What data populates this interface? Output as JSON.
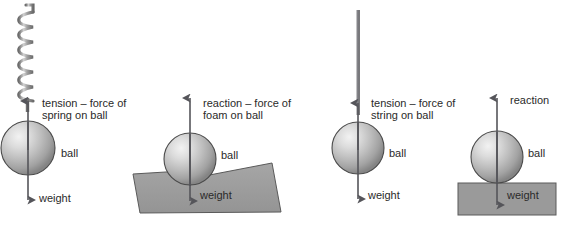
{
  "figure": {
    "background_color": "#ffffff",
    "ball_label": "ball",
    "weight_label": "weight",
    "colors": {
      "ball_fill_light": "#eeeeee",
      "ball_fill_mid": "#b9b9b9",
      "ball_fill_dark": "#8a8a8a",
      "ball_outline": "#4a4a4a",
      "support_fill": "#9a9a9a",
      "support_outline": "#5a5a5a",
      "arrow": "#55555a",
      "spring": "#7a7a7a",
      "string": "#5f5f63",
      "text": "#2a2a2a"
    }
  },
  "panels": [
    {
      "id": "spring-ball",
      "name": "ball-hanging-from-spring",
      "support_type": "spring",
      "up_force_label_line1": "tension – force of",
      "up_force_label_line2": "spring on ball",
      "up_force_name": "tension",
      "down_force_label": "weight",
      "ball_label": "ball"
    },
    {
      "id": "foam-ball",
      "name": "ball-resting-on-foam",
      "support_type": "foam",
      "up_force_label_line1": "reaction – force of",
      "up_force_label_line2": "foam on ball",
      "up_force_name": "reaction",
      "down_force_label": "weight",
      "ball_label": "ball"
    },
    {
      "id": "string-ball",
      "name": "ball-hanging-from-string",
      "support_type": "string",
      "up_force_label_line1": "tension – force of",
      "up_force_label_line2": "string on ball",
      "up_force_name": "tension",
      "down_force_label": "weight",
      "ball_label": "ball"
    },
    {
      "id": "ground-ball",
      "name": "ball-resting-on-ground",
      "support_type": "ground",
      "up_force_label_line1": "reaction",
      "up_force_label_line2": "",
      "up_force_name": "reaction",
      "down_force_label": "weight",
      "ball_label": "ball"
    }
  ]
}
